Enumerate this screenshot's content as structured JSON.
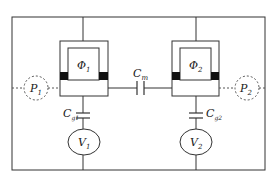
{
  "diagram": {
    "type": "circuit",
    "labels": {
      "phi1": "Φ",
      "phi1_sub": "1",
      "phi2": "Φ",
      "phi2_sub": "2",
      "cm": "C",
      "cm_sub": "m",
      "p1": "P",
      "p1_sub": "1",
      "p2": "P",
      "p2_sub": "2",
      "cg1": "C",
      "cg1_sub": "g1",
      "cg2": "C",
      "cg2_sub": "g2",
      "v1": "V",
      "v1_sub": "1",
      "v2": "V",
      "v2_sub": "2"
    },
    "colors": {
      "line": "#333333",
      "junction": "#111111",
      "dashed": "#555555"
    }
  }
}
